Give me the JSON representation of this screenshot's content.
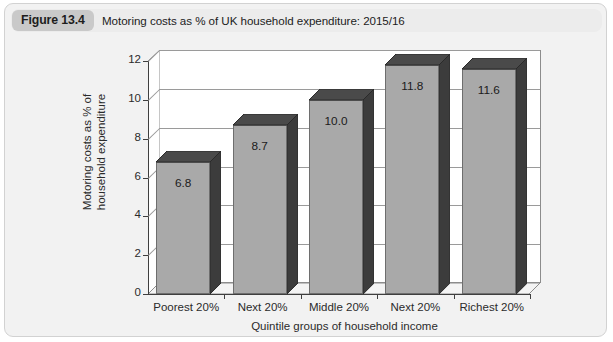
{
  "figure": {
    "badge_label": "Figure 13.4",
    "caption": "Motoring costs as % of UK household expenditure: 2015/16"
  },
  "colors": {
    "card_background": "#f2f2f2",
    "card_border": "#d2d2d2",
    "caption_bar": "#ececec",
    "badge_background": "#c9c9c9",
    "plot_background": "#ffffff",
    "bar_front": "#a9a9a9",
    "bar_top": "#4a4a4a",
    "bar_side": "#3c3c3c",
    "gridline": "#9a9a9a",
    "axis": "#3f3f3f",
    "text": "#2b2b2b"
  },
  "chart_data": {
    "type": "bar",
    "title": "Motoring costs as % of UK household expenditure: 2015/16",
    "categories": [
      "Poorest 20%",
      "Next 20%",
      "Middle 20%",
      "Next 20%",
      "Richest 20%"
    ],
    "values": [
      6.8,
      8.7,
      10.0,
      11.8,
      11.6
    ],
    "value_labels": [
      "6.8",
      "8.7",
      "10.0",
      "11.8",
      "11.6"
    ],
    "xlabel": "Quintile groups of household income",
    "ylabel_line1": "Motoring costs as % of",
    "ylabel_line2": "household expenditure",
    "ylim": [
      0,
      12
    ],
    "ytick_values": [
      0,
      2,
      4,
      6,
      8,
      10,
      12
    ],
    "ytick_labels": [
      "0",
      "2",
      "4",
      "6",
      "8",
      "10",
      "12"
    ],
    "grid": true,
    "legend": false,
    "three_d": true
  }
}
